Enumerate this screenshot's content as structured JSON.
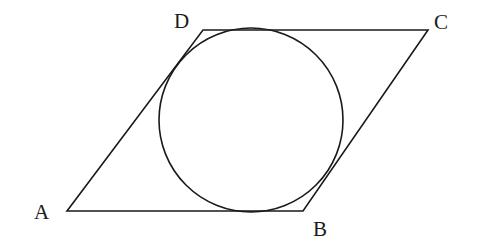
{
  "diagram": {
    "type": "parallelogram-with-inscribed-circle",
    "stroke_color": "#1a1a1a",
    "background": "#ffffff",
    "vertices": {
      "A": {
        "label": "A",
        "x": 67,
        "y": 211,
        "label_x": 34,
        "label_y": 202
      },
      "B": {
        "label": "B",
        "x": 303,
        "y": 211,
        "label_x": 313,
        "label_y": 219
      },
      "C": {
        "label": "C",
        "x": 428,
        "y": 30,
        "label_x": 434,
        "label_y": 12
      },
      "D": {
        "label": "D",
        "x": 203,
        "y": 30,
        "label_x": 174,
        "label_y": 11
      }
    },
    "circle": {
      "cx": 251,
      "cy": 120,
      "r": 92
    }
  }
}
